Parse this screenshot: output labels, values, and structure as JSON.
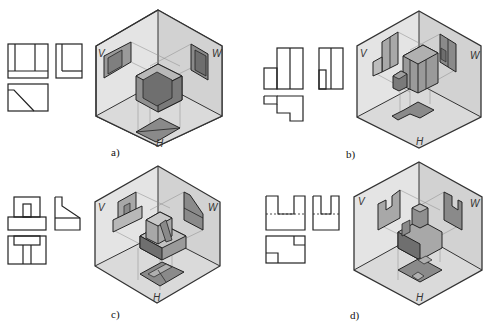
{
  "figure": {
    "panels": [
      {
        "id": "a",
        "caption": "a)",
        "planes": {
          "v": "V",
          "w": "W",
          "h": "H"
        }
      },
      {
        "id": "b",
        "caption": "b)",
        "planes": {
          "v": "V",
          "w": "W",
          "h": "H"
        }
      },
      {
        "id": "c",
        "caption": "c)",
        "planes": {
          "v": "V",
          "w": "W",
          "h": "H"
        }
      },
      {
        "id": "d",
        "caption": "d)",
        "planes": {
          "v": "V",
          "w": "W",
          "h": "H"
        }
      }
    ]
  },
  "colors": {
    "line": "#2a2a2a",
    "plane_left": "#e6e6e6",
    "plane_right": "#d4d4d4",
    "plane_bottom": "#dcdcdc",
    "face_dark": "#7a7a7a",
    "face_mid": "#9a9a9a",
    "face_light": "#bdbdbd",
    "projection_line": "#8a8a8a"
  }
}
